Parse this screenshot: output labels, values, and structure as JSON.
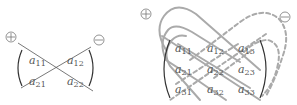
{
  "figure_2x2": {
    "plus_label": "+",
    "minus_label": "−",
    "entries": [
      {
        "base": "a",
        "sub": "11"
      },
      {
        "base": "a",
        "sub": "12"
      },
      {
        "base": "a",
        "sub": "21"
      },
      {
        "base": "a",
        "sub": "22"
      }
    ]
  },
  "figure_3x3": {
    "plus_label": "+",
    "minus_label": "−",
    "entries": [
      {
        "base": "a",
        "sub": "11"
      },
      {
        "base": "a",
        "sub": "12"
      },
      {
        "base": "a",
        "sub": "13"
      },
      {
        "base": "a",
        "sub": "21"
      },
      {
        "base": "a",
        "sub": "22"
      },
      {
        "base": "a",
        "sub": "23"
      },
      {
        "base": "a",
        "sub": "31"
      },
      {
        "base": "a",
        "sub": "32"
      },
      {
        "base": "a",
        "sub": "33"
      }
    ]
  },
  "colors": {
    "line_dark": "#555555",
    "line_gray": "#aaaaaa",
    "text": "#555555"
  }
}
